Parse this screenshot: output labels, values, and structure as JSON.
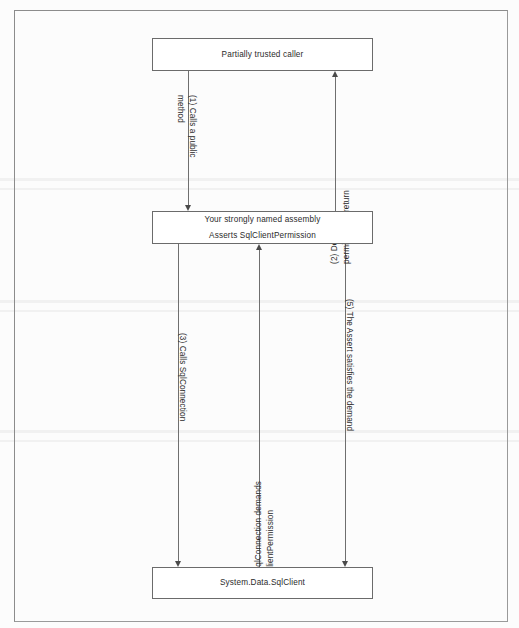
{
  "diagram": {
    "nodes": [
      {
        "id": "caller",
        "lines": [
          "Partially trusted caller"
        ]
      },
      {
        "id": "assembly",
        "lines": [
          "Your strongly named assembly",
          "Asserts SqlClientPermission"
        ]
      },
      {
        "id": "sqlclient",
        "lines": [
          "System.Data.SqlClient"
        ]
      }
    ],
    "edges": [
      {
        "id": "edge-1",
        "label_lines": [
          "(1) Calls a public",
          "method"
        ],
        "direction": "down",
        "from": "caller",
        "to": "assembly"
      },
      {
        "id": "edge-2",
        "label_lines": [
          "(2) Demand a",
          "permission in return"
        ],
        "direction": "up",
        "from": "assembly",
        "to": "caller"
      },
      {
        "id": "edge-3",
        "label_lines": [
          "(3) Calls SqlConnection"
        ],
        "direction": "down",
        "from": "assembly",
        "to": "sqlclient"
      },
      {
        "id": "edge-4",
        "label_lines": [
          "(4) SqlConnection demands",
          "SqlClientPermission"
        ],
        "direction": "up",
        "from": "sqlclient",
        "to": "assembly"
      },
      {
        "id": "edge-5",
        "label_lines": [
          "(5) The Assert satisfies the demand"
        ],
        "direction": "down",
        "from": "assembly",
        "to": "sqlclient"
      }
    ],
    "colors": {
      "page_background": "#fcfcfc",
      "frame_border": "#8c8c8c",
      "node_border": "#6b6b6b",
      "connector": "#6f6f6f",
      "text": "#2b2b2b"
    }
  }
}
